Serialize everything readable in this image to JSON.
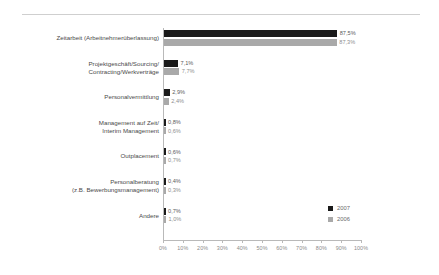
{
  "chart_data": {
    "type": "bar",
    "orientation": "horizontal",
    "title": "",
    "xlabel": "",
    "ylabel": "",
    "xlim": [
      0,
      100
    ],
    "xtick_labels": [
      "0%",
      "10%",
      "20%",
      "30%",
      "40%",
      "50%",
      "60%",
      "70%",
      "80%",
      "90%",
      "100%"
    ],
    "xtick_values": [
      0,
      10,
      20,
      30,
      40,
      50,
      60,
      70,
      80,
      90,
      100
    ],
    "grid": false,
    "legend_position": "right-bottom",
    "value_suffix": "%",
    "decimal_separator": ",",
    "categories": [
      "Zeitarbeit (Arbeitnehmerüberlassung)",
      "Projektgeschäft/Sourcing/\nContracting/Werkverträge",
      "Personalvermittlung",
      "Management auf Zeit/\nInterim Management",
      "Outplacement",
      "Personalberatung\n(z.B. Bewerbungsmanagement)",
      "Andere"
    ],
    "series": [
      {
        "name": "2007",
        "color": "#1a1a1a",
        "values": [
          87.5,
          7.1,
          2.9,
          0.8,
          0.6,
          0.4,
          0.7
        ],
        "labels": [
          "87,5%",
          "7,1%",
          "2,9%",
          "0,8%",
          "0,6%",
          "0,4%",
          "0,7%"
        ]
      },
      {
        "name": "2006",
        "color": "#a9a9a9",
        "values": [
          87.3,
          7.7,
          2.4,
          0.6,
          0.7,
          0.3,
          1.0
        ],
        "labels": [
          "87,3%",
          "7,7%",
          "2,4%",
          "0,6%",
          "0,7%",
          "0,3%",
          "1,0%"
        ]
      }
    ]
  },
  "legend": {
    "items": [
      {
        "label": "2007",
        "color": "#1a1a1a"
      },
      {
        "label": "2006",
        "color": "#a9a9a9"
      }
    ]
  },
  "axis": {
    "ticks": [
      {
        "label": "0%"
      },
      {
        "label": "10%"
      },
      {
        "label": "20%"
      },
      {
        "label": "30%"
      },
      {
        "label": "40%"
      },
      {
        "label": "50%"
      },
      {
        "label": "60%"
      },
      {
        "label": "70%"
      },
      {
        "label": "80%"
      },
      {
        "label": "90%"
      },
      {
        "label": "100%"
      }
    ]
  }
}
